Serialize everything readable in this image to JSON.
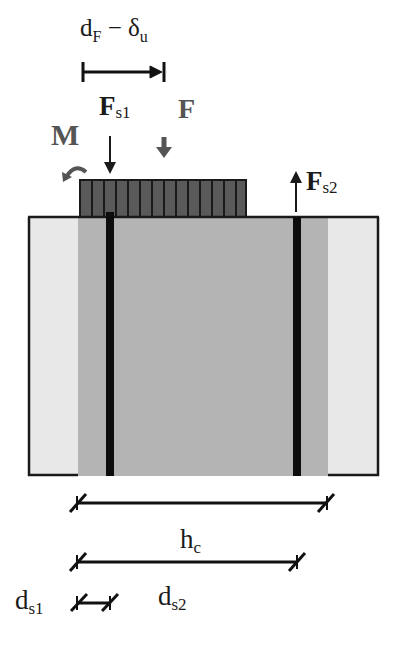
{
  "diagram": {
    "colors": {
      "background": "#ffffff",
      "outline": "#1a1a1a",
      "cover_zone": "#e8e8e8",
      "core_zone": "#b4b4b4",
      "plate_fill": "#5a5a5a",
      "plate_lines": "#1a1a1a",
      "rebar": "#0d0d0d",
      "load_arrow": "#555555",
      "text": "#1a1a1a"
    },
    "labels": {
      "top_dimension": {
        "main": "d",
        "sub": "F",
        "minus": " − ",
        "main2": "δ",
        "sub2": "u"
      },
      "moment": "M",
      "fs1": {
        "main": "F",
        "sub": "s1"
      },
      "force": "F",
      "fs2": {
        "main": "F",
        "sub": "s2"
      },
      "hc": {
        "main": "h",
        "sub": "c"
      },
      "ds2": {
        "main": "d",
        "sub": "s2"
      },
      "ds1": {
        "main": "d",
        "sub": "s1"
      }
    },
    "elements": {
      "section_box": {
        "x": 28,
        "y": 217,
        "w": 351,
        "h": 259
      },
      "core": {
        "x": 78,
        "w": 250
      },
      "plate": {
        "x": 80,
        "y": 180,
        "w": 166,
        "h": 37,
        "stripes": 14
      },
      "rebar_left_x": 110,
      "rebar_right_x": 297
    }
  }
}
